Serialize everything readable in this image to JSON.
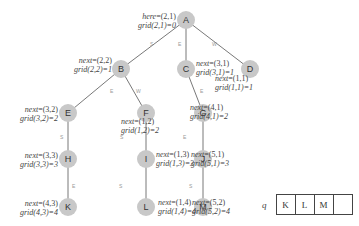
{
  "diagram": {
    "nodes": [
      {
        "id": "A",
        "label": "A",
        "var": "here",
        "coord": "=(2,1)",
        "grid": "grid(2,1)=0"
      },
      {
        "id": "B",
        "label": "B",
        "var": "next",
        "coord": "=(2,2)",
        "grid": "grid(2,2)=1"
      },
      {
        "id": "C",
        "label": "C",
        "var": "next",
        "coord": "=(3,1)",
        "grid": "grid(3,1)=1"
      },
      {
        "id": "D",
        "label": "D",
        "var": "next",
        "coord": "=(1,1)",
        "grid": "grid(1,1)=1"
      },
      {
        "id": "E",
        "label": "E",
        "var": "next",
        "coord": "=(3,2)",
        "grid": "grid(3,2)=2"
      },
      {
        "id": "F",
        "label": "F",
        "var": "next",
        "coord": "=(1,2)",
        "grid": "grid(1,2)=2"
      },
      {
        "id": "G",
        "label": "G",
        "var": "next",
        "coord": "=(4,1)",
        "grid": "grid(4,1)=2"
      },
      {
        "id": "H",
        "label": "H",
        "var": "next",
        "coord": "=(3,3)",
        "grid": "grid(3,3)=3"
      },
      {
        "id": "I",
        "label": "I",
        "var": "next",
        "coord": "=(1,3)",
        "grid": "grid(1,3)=3"
      },
      {
        "id": "J",
        "label": "J",
        "var": "next",
        "coord": "=(5,1)",
        "grid": "grid(5,1)=3"
      },
      {
        "id": "K",
        "label": "K",
        "var": "next",
        "coord": "=(4,3)",
        "grid": "grid(4,3)=4"
      },
      {
        "id": "L",
        "label": "L",
        "var": "next",
        "coord": "=(1,4)",
        "grid": "grid(1,4)=4"
      },
      {
        "id": "M",
        "label": "M",
        "var": "next",
        "coord": "=(5,2)",
        "grid": "grid(5,2)=4"
      }
    ],
    "edges": [
      {
        "from": "A",
        "to": "B",
        "label": "S"
      },
      {
        "from": "A",
        "to": "C",
        "label": "E"
      },
      {
        "from": "A",
        "to": "D",
        "label": "W"
      },
      {
        "from": "B",
        "to": "E",
        "label": "E"
      },
      {
        "from": "B",
        "to": "F",
        "label": "W"
      },
      {
        "from": "C",
        "to": "G",
        "label": "E"
      },
      {
        "from": "E",
        "to": "H",
        "label": "S"
      },
      {
        "from": "F",
        "to": "I",
        "label": "S"
      },
      {
        "from": "G",
        "to": "J",
        "label": "E"
      },
      {
        "from": "H",
        "to": "K",
        "label": "E"
      },
      {
        "from": "I",
        "to": "L",
        "label": "S"
      },
      {
        "from": "J",
        "to": "M",
        "label": "S"
      }
    ],
    "queue": {
      "label": "q",
      "cells": [
        "K",
        "L",
        "M",
        ""
      ]
    }
  }
}
